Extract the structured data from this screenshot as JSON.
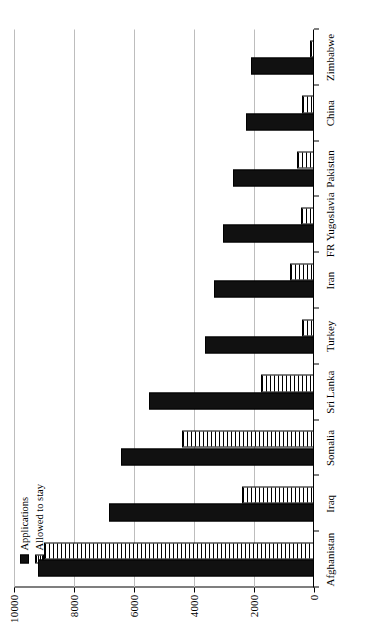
{
  "chart_data": {
    "type": "bar",
    "orientation": "horizontal",
    "title": "",
    "xlabel": "",
    "ylabel": "",
    "ylim": [
      0,
      10000
    ],
    "yticks": [
      0,
      2000,
      4000,
      6000,
      8000,
      10000
    ],
    "ytick_labels": [
      "0",
      "2000",
      "4000",
      "6000",
      "8000",
      "10000"
    ],
    "grid": true,
    "legend_position": "top-left",
    "categories": [
      "Afghanistan",
      "Iraq",
      "Somalia",
      "Sri Lanka",
      "Turkey",
      "Iran",
      "FR Yugoslavia",
      "Pakistan",
      "China",
      "Zimbabwe"
    ],
    "series": [
      {
        "name": "Applications",
        "color": "#111111",
        "pattern": "solid",
        "values": [
          9200,
          6840,
          6440,
          5490,
          3620,
          3345,
          3040,
          2700,
          2270,
          2090
        ]
      },
      {
        "name": "Allowed to stay",
        "color": "#ffffff",
        "pattern": "horizontal-hatch",
        "values": [
          9000,
          2390,
          4390,
          1780,
          390,
          800,
          450,
          560,
          400,
          130
        ]
      }
    ]
  },
  "legend": {
    "items": [
      {
        "label": "Applications",
        "swatch": "applications"
      },
      {
        "label": "Allowed to stay",
        "swatch": "allowed"
      }
    ]
  }
}
